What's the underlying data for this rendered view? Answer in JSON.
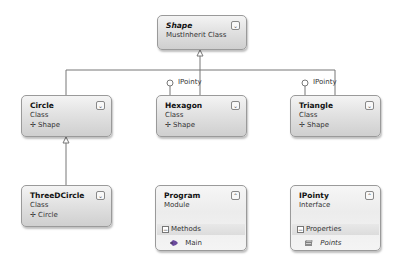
{
  "diagram": {
    "type": "class-diagram",
    "nodes": [
      {
        "id": "shape",
        "name": "Shape",
        "kind": "MustInherit Class",
        "base": null,
        "name_italic": true
      },
      {
        "id": "circle",
        "name": "Circle",
        "kind": "Class",
        "base": "Shape"
      },
      {
        "id": "hexagon",
        "name": "Hexagon",
        "kind": "Class",
        "base": "Shape",
        "implements": "IPointy"
      },
      {
        "id": "triangle",
        "name": "Triangle",
        "kind": "Class",
        "base": "Shape",
        "implements": "IPointy"
      },
      {
        "id": "threedcircle",
        "name": "ThreeDCircle",
        "kind": "Class",
        "base": "Circle"
      },
      {
        "id": "program",
        "name": "Program",
        "kind": "Module",
        "section": "Methods",
        "members": [
          "Main"
        ]
      },
      {
        "id": "ipointy",
        "name": "IPointy",
        "kind": "Interface",
        "section": "Properties",
        "members": [
          "Points"
        ]
      }
    ],
    "edges": [
      {
        "from": "circle",
        "to": "shape",
        "type": "inheritance"
      },
      {
        "from": "hexagon",
        "to": "shape",
        "type": "inheritance"
      },
      {
        "from": "triangle",
        "to": "shape",
        "type": "inheritance"
      },
      {
        "from": "threedcircle",
        "to": "circle",
        "type": "inheritance"
      },
      {
        "from": "hexagon",
        "to": "ipointy",
        "type": "implements-lollipop"
      },
      {
        "from": "triangle",
        "to": "ipointy",
        "type": "implements-lollipop"
      }
    ]
  },
  "shape": {
    "name": "Shape",
    "kind": "MustInherit Class",
    "toggle": "⌄"
  },
  "circle": {
    "name": "Circle",
    "kind": "Class",
    "base": "✢ Shape",
    "toggle": "⌄"
  },
  "hexagon": {
    "name": "Hexagon",
    "kind": "Class",
    "base": "✢ Shape",
    "toggle": "⌄",
    "lollipop": "IPointy"
  },
  "triangle": {
    "name": "Triangle",
    "kind": "Class",
    "base": "✢ Shape",
    "toggle": "⌄",
    "lollipop": "IPointy"
  },
  "threedcircle": {
    "name": "ThreeDCircle",
    "kind": "Class",
    "base": "✢ Circle",
    "toggle": "⌄"
  },
  "program": {
    "name": "Program",
    "kind": "Module",
    "toggle": "⌃",
    "section": "Methods",
    "section_toggle": "−",
    "member": "Main",
    "member_icon": "method-icon"
  },
  "ipointy": {
    "name": "IPointy",
    "kind": "Interface",
    "toggle": "⌃",
    "section": "Properties",
    "section_toggle": "−",
    "member": "Points",
    "member_icon": "property-icon"
  }
}
